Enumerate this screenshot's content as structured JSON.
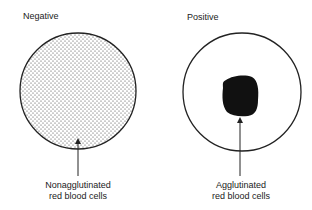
{
  "panels": [
    {
      "title": "Negative",
      "caption_line1": "Nonagglutinated",
      "caption_line2": "red blood cells",
      "fill": "stippled dots"
    },
    {
      "title": "Positive",
      "caption_line1": "Agglutinated",
      "caption_line2": "red blood cells",
      "fill": "central dark clump"
    }
  ],
  "colors": {
    "stroke": "#222222",
    "background": "#ffffff",
    "dots": "#333333",
    "clump": "#111111"
  }
}
